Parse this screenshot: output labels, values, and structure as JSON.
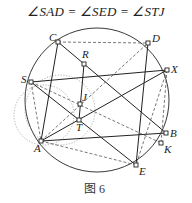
{
  "title": "∠SAD = ∠SED = ∠STJ",
  "caption": "图 6",
  "colors": {
    "line": "#222222",
    "dashed": "#555555",
    "dotted": "#9a9a9a",
    "background": "#ffffff"
  },
  "circle": {
    "cx": 97,
    "cy": 100,
    "r": 72
  },
  "aux_circles": [
    {
      "type": "dotted",
      "cx": 44,
      "cy": 115,
      "r": 30
    },
    {
      "type": "dotted",
      "cx": 60,
      "cy": 110,
      "r": 35
    }
  ],
  "points": {
    "C": {
      "x": 58,
      "y": 42,
      "label": "C"
    },
    "D": {
      "x": 148,
      "y": 43,
      "label": "D"
    },
    "R": {
      "x": 84,
      "y": 64,
      "label": "R"
    },
    "S": {
      "x": 31,
      "y": 82,
      "label": "S"
    },
    "X": {
      "x": 167,
      "y": 70,
      "label": "X"
    },
    "J": {
      "x": 80,
      "y": 104,
      "label": "J"
    },
    "T": {
      "x": 79,
      "y": 120,
      "label": "T"
    },
    "A": {
      "x": 41,
      "y": 141,
      "label": "A"
    },
    "B": {
      "x": 166,
      "y": 133,
      "label": "B"
    },
    "K": {
      "x": 161,
      "y": 143,
      "label": "K"
    },
    "E": {
      "x": 136,
      "y": 165,
      "label": "E"
    }
  },
  "segments": [
    {
      "from": "S",
      "to": "X",
      "style": "solid"
    },
    {
      "from": "C",
      "to": "B",
      "style": "solid"
    },
    {
      "from": "C",
      "to": "A",
      "style": "solid"
    },
    {
      "from": "R",
      "to": "T",
      "style": "solid"
    },
    {
      "from": "A",
      "to": "X",
      "style": "solid"
    },
    {
      "from": "A",
      "to": "B",
      "style": "solid"
    },
    {
      "from": "S",
      "to": "E",
      "style": "solid"
    },
    {
      "from": "D",
      "to": "E",
      "style": "solid"
    },
    {
      "from": "C",
      "to": "D",
      "style": "dashed"
    },
    {
      "from": "A",
      "to": "D",
      "style": "dashed"
    },
    {
      "from": "S",
      "to": "A",
      "style": "dashed"
    },
    {
      "from": "S",
      "to": "K",
      "style": "dashed"
    },
    {
      "from": "A",
      "to": "E",
      "style": "dashed"
    },
    {
      "from": "X",
      "to": "E",
      "style": "dashed"
    },
    {
      "from": "X",
      "to": "K",
      "style": "dashed"
    }
  ]
}
